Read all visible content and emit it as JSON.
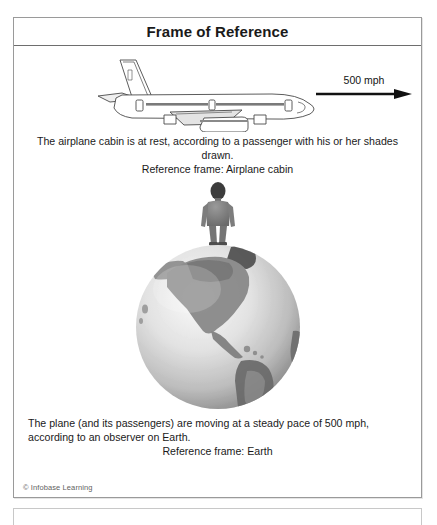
{
  "figure": {
    "title": "Frame of Reference",
    "copyright": "© Infobase Learning",
    "panel_top": {
      "plane_icon": "airplane-side-view",
      "speed_label": "500 mph",
      "arrow_icon": "right-arrow",
      "caption": "The airplane cabin is at rest, according to a passenger with his or her shades drawn.",
      "reference_frame": "Reference frame: Airplane cabin"
    },
    "panel_bottom": {
      "globe_icon": "earth-globe",
      "person_icon": "standing-person",
      "caption": "The plane (and its passengers) are moving at a steady pace of 500 mph, according to an observer on Earth.",
      "reference_frame": "Reference frame: Earth"
    }
  },
  "colors": {
    "border": "#9a9a9a",
    "title_rule": "#6e6e6e",
    "text": "#1a1a1a",
    "muted_text": "#5f5f5f",
    "arrow": "#111111"
  }
}
